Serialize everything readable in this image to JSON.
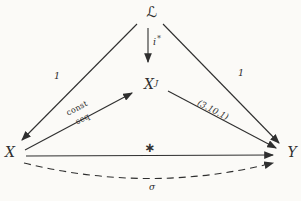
{
  "diagram": {
    "background": "#fbfaf7",
    "ink": "#2f2f2f",
    "nodes": {
      "L": {
        "label": "ℒ"
      },
      "XJ": {
        "base": "X",
        "sup": "J"
      },
      "X": {
        "label": "X"
      },
      "Y": {
        "label": "Y"
      }
    },
    "arrow_labels": {
      "i_star": {
        "base": "i",
        "sup": "*"
      },
      "left_side": "1",
      "right_side": "1",
      "const_over_seq": {
        "top": "const",
        "bottom": "seq"
      },
      "reference": "(3.10.1)",
      "star": "∗",
      "sigma": "σ"
    }
  }
}
